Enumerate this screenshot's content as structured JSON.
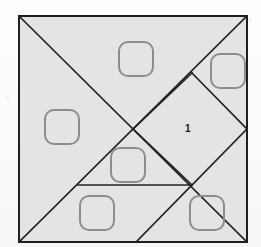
{
  "figure": {
    "kind": "tangram-dissection-diagram",
    "colors": {
      "page_background": "#fdfdfc",
      "square_fill": "#e4e4e2",
      "square_border": "#1f1f1f",
      "cut_line": "#232323",
      "marker_stroke": "#8d8d8d",
      "label_text": "#1c1c1c"
    },
    "outer_square": {
      "name": "tangram-outer-square",
      "x": 19,
      "y": 16,
      "width": 228,
      "height": 226,
      "stroke_width": 2
    },
    "cut_lines": [
      {
        "name": "cut-main-diagonal-tl-br",
        "x1": 19,
        "y1": 16,
        "x2": 247,
        "y2": 242
      },
      {
        "name": "cut-main-diagonal-tr-bl",
        "x1": 247,
        "y1": 16,
        "x2": 19,
        "y2": 242
      },
      {
        "name": "cut-diamond-upper-left",
        "x1": 192,
        "y1": 73,
        "x2": 133,
        "y2": 129
      },
      {
        "name": "cut-diamond-upper-right",
        "x1": 192,
        "y1": 73,
        "x2": 247,
        "y2": 129
      },
      {
        "name": "cut-diamond-lower-right",
        "x1": 247,
        "y1": 129,
        "x2": 192,
        "y2": 185
      },
      {
        "name": "cut-diamond-lower-left",
        "x1": 192,
        "y1": 185,
        "x2": 133,
        "y2": 129
      },
      {
        "name": "cut-horizontal-midlow",
        "x1": 78,
        "y1": 185,
        "x2": 192,
        "y2": 185
      },
      {
        "name": "cut-diagonal-bottom-up",
        "x1": 136,
        "y1": 242,
        "x2": 192,
        "y2": 185
      }
    ],
    "markers": [
      {
        "name": "piece-marker-top",
        "x": 119,
        "y": 42,
        "size": 34
      },
      {
        "name": "piece-marker-top-right",
        "x": 211,
        "y": 54,
        "size": 34
      },
      {
        "name": "piece-marker-left",
        "x": 45,
        "y": 110,
        "size": 34
      },
      {
        "name": "piece-marker-center",
        "x": 111,
        "y": 148,
        "size": 34
      },
      {
        "name": "piece-marker-bottom-left",
        "x": 80,
        "y": 196,
        "size": 34
      },
      {
        "name": "piece-marker-bottom-right",
        "x": 190,
        "y": 196,
        "size": 34
      }
    ],
    "labels": [
      {
        "name": "region-label-1",
        "text": "1",
        "x": 185,
        "y": 124
      }
    ]
  }
}
